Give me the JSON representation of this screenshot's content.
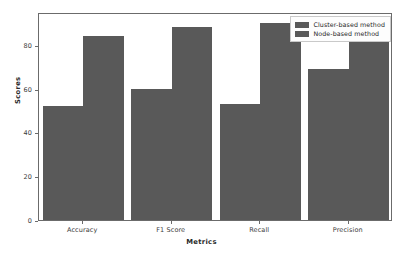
{
  "chart_data": {
    "type": "bar",
    "title": "",
    "xlabel": "Metrics",
    "ylabel": "Scores",
    "categories": [
      "Accuracy",
      "F1 Score",
      "Recall",
      "Precision"
    ],
    "series": [
      {
        "name": "Cluster-based method",
        "values": [
          52,
          60,
          53,
          69
        ],
        "color": "#595959"
      },
      {
        "name": "Node-based method",
        "values": [
          84,
          88,
          90,
          84
        ],
        "color": "#595959"
      }
    ],
    "ylim": [
      0,
      95
    ],
    "yticks": [
      0,
      20,
      40,
      60,
      80
    ],
    "ytick_labels": [
      "0",
      "20",
      "40",
      "60",
      "80"
    ],
    "grid": false,
    "legend_position": "upper right"
  },
  "legend": {
    "entries": [
      {
        "label": "Cluster-based method"
      },
      {
        "label": "Node-based method"
      }
    ]
  },
  "axes": {
    "y_title": "Scores",
    "x_title": "Metrics"
  }
}
